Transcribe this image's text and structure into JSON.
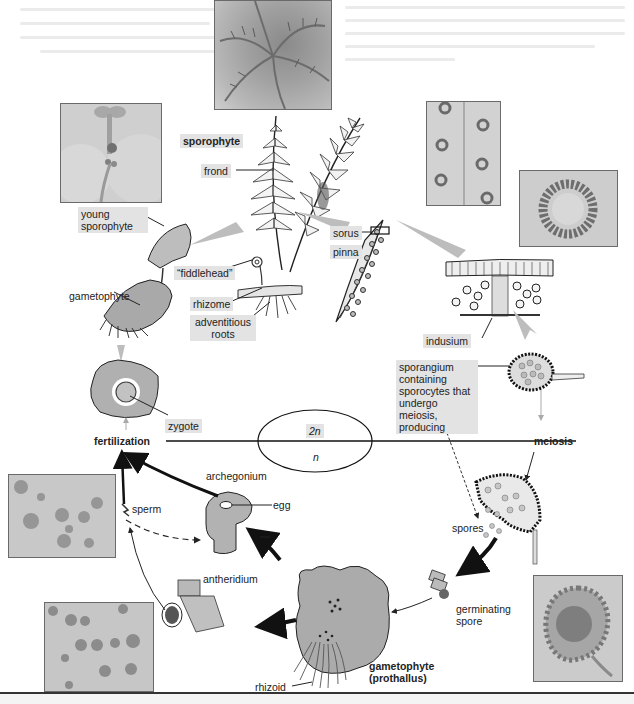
{
  "phases": {
    "diploid": "2n",
    "haploid": "n"
  },
  "stages": {
    "fertilization": "fertilization",
    "meiosis": "meiosis"
  },
  "labels": {
    "sporophyte": "sporophyte",
    "frond": "frond",
    "young_sporophyte": "young sporophyte",
    "fiddlehead": "“fiddlehead”",
    "gametophyte_top": "gametophyte",
    "rhizome": "rhizome",
    "adventitious_roots": "adventitious roots",
    "sorus": "sorus",
    "pinna": "pinna",
    "indusium": "indusium",
    "sporangium": "sporangium containing sporocytes that undergo meiosis, producing",
    "zygote": "zygote",
    "archegonium": "archegonium",
    "egg": "egg",
    "sperm": "sperm",
    "spores": "spores",
    "antheridium": "antheridium",
    "germinating_spore": "germinating spore",
    "gametophyte_prothallus": "gametophyte (prothallus)",
    "rhizoid": "rhizoid"
  },
  "photos": [
    {
      "id": "fern-plant",
      "subject": "mature fern plant"
    },
    {
      "id": "young-sporophyte",
      "subject": "young sporophyte micrograph"
    },
    {
      "id": "sori-on-pinna",
      "subject": "sori on underside of pinna"
    },
    {
      "id": "sorus-closeup",
      "subject": "sorus close-up"
    },
    {
      "id": "archegonia",
      "subject": "archegonia micrograph"
    },
    {
      "id": "antheridia",
      "subject": "antheridia micrograph"
    },
    {
      "id": "sporangium",
      "subject": "sporangium micrograph"
    }
  ],
  "colors": {
    "label_bg": "#e3e3e3",
    "arrow_gray": "#bdbdbd",
    "arrow_black": "#111111",
    "cell_fill": "#b0b0b0"
  }
}
